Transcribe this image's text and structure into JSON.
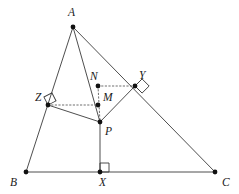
{
  "figure": {
    "width": 239,
    "height": 194,
    "background_color": "#ffffff",
    "stroke_color": "#3a3a3a",
    "dot_color": "#111111",
    "dotted_color": "#555555"
  },
  "points": [
    {
      "name": "A",
      "label": "A",
      "x": 73,
      "y": 27,
      "label_x": 68,
      "label_y": 7,
      "dot": true
    },
    {
      "name": "B",
      "label": "B",
      "x": 26,
      "y": 172,
      "label_x": 10,
      "label_y": 177,
      "dot": true
    },
    {
      "name": "C",
      "label": "C",
      "x": 215,
      "y": 172,
      "label_x": 222,
      "label_y": 177,
      "dot": true
    },
    {
      "name": "X",
      "label": "X",
      "x": 100,
      "y": 172,
      "label_x": 99,
      "label_y": 177,
      "dot": true
    },
    {
      "name": "P",
      "label": "P",
      "x": 100,
      "y": 122,
      "label_x": 105,
      "label_y": 126,
      "dot": true
    },
    {
      "name": "M",
      "label": "M",
      "x": 98,
      "y": 105,
      "label_x": 103,
      "label_y": 92,
      "dot": true
    },
    {
      "name": "N",
      "label": "N",
      "x": 98,
      "y": 86,
      "label_x": 90,
      "label_y": 71,
      "dot": true
    },
    {
      "name": "Y",
      "label": "Y",
      "x": 135,
      "y": 86,
      "label_x": 139,
      "label_y": 70,
      "dot": true
    },
    {
      "name": "Z",
      "label": "Z",
      "x": 48,
      "y": 105,
      "label_x": 35,
      "label_y": 92,
      "dot": true
    }
  ],
  "solid_segments": [
    {
      "name": "side-AB",
      "from": "A",
      "to": "B"
    },
    {
      "name": "side-AC",
      "from": "A",
      "to": "C"
    },
    {
      "name": "side-BC",
      "from": "B",
      "to": "C"
    },
    {
      "name": "cevian-AP",
      "from": "A",
      "to": "P"
    },
    {
      "name": "altitude-PX",
      "from": "P",
      "to": "X"
    },
    {
      "name": "segment-ZP",
      "from": "Z",
      "to": "P"
    },
    {
      "name": "segment-PY",
      "from": "P",
      "to": "Y"
    }
  ],
  "dotted_segments": [
    {
      "name": "dotted-ZM",
      "from": "Z",
      "to": "M"
    },
    {
      "name": "dotted-NY",
      "from": "N",
      "to": "Y"
    },
    {
      "name": "dotted-NP",
      "from": "N",
      "to": "P"
    }
  ],
  "right_angle_marks": [
    {
      "name": "right-angle-at-X",
      "at": "X",
      "size": 9,
      "rotation_deg": 0,
      "vertex_dx": 0,
      "vertex_dy": 0
    },
    {
      "name": "right-angle-at-Z",
      "at": "Z",
      "size": 9,
      "rotation_deg": -27,
      "vertex_dx": 0,
      "vertex_dy": 0
    },
    {
      "name": "right-angle-at-Y",
      "at": "Y",
      "size": 10,
      "rotation_deg": 45,
      "vertex_dx": 0,
      "vertex_dy": 0
    }
  ],
  "geometry_notes": {
    "dot_radius": 2.4,
    "stroke_width": 0.9,
    "dash_pattern": "1.4 2.2"
  }
}
